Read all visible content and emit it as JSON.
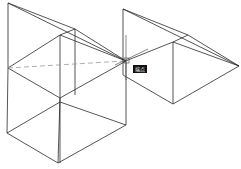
{
  "canvas": {
    "background": "#ffffff",
    "line_color": "#2a2a2a",
    "dashed_line_color": "#9a9a9a",
    "cursor_color": "#555555"
  },
  "snap_tooltip": {
    "label": "端点",
    "background": "#111111"
  },
  "objects": [
    {
      "name": "left-box-with-wedge",
      "type": "3d-wireframe"
    },
    {
      "name": "right-wedge",
      "type": "3d-wireframe"
    }
  ]
}
